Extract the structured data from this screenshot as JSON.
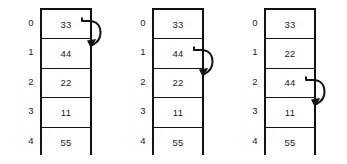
{
  "diagram": {
    "arrays": [
      {
        "name": "array-step-1",
        "indices": [
          "0",
          "1",
          "2",
          "3",
          "4"
        ],
        "values": [
          "33",
          "44",
          "22",
          "11",
          "55"
        ],
        "arrow": {
          "name": "swap-arrow-0-to-1",
          "from_index": 0,
          "to_index": 1
        }
      },
      {
        "name": "array-step-2",
        "indices": [
          "0",
          "1",
          "2",
          "3",
          "4"
        ],
        "values": [
          "33",
          "44",
          "22",
          "11",
          "55"
        ],
        "arrow": {
          "name": "swap-arrow-1-to-2",
          "from_index": 1,
          "to_index": 2
        }
      },
      {
        "name": "array-step-3",
        "indices": [
          "0",
          "1",
          "2",
          "3",
          "4"
        ],
        "values": [
          "33",
          "22",
          "44",
          "11",
          "55"
        ],
        "arrow": {
          "name": "swap-arrow-2-to-3",
          "from_index": 2,
          "to_index": 3
        }
      }
    ],
    "colors": {
      "border": "#121212",
      "text": "#1b1b1b",
      "background": "#ffffff"
    }
  }
}
